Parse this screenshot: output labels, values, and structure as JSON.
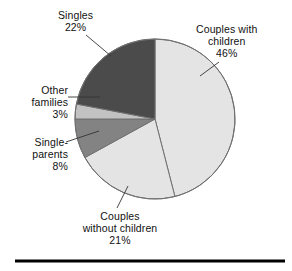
{
  "chart_data": {
    "type": "pie",
    "title": "",
    "subtitle": "",
    "xlabel": "",
    "ylabel": "",
    "legend_position": "none",
    "grid": false,
    "start_angle_deg": 0,
    "direction": "clockwise",
    "units": "percent",
    "categories": [
      "Couples with children",
      "Couples without children",
      "Single-parents",
      "Other families",
      "Singles"
    ],
    "values": [
      46,
      21,
      8,
      3,
      22
    ],
    "slices": [
      {
        "name": "couples-with-children",
        "label_lines": [
          "Couples with",
          "children",
          "46%"
        ],
        "value": 46,
        "value_text": "46%",
        "color": "#e4e4e4",
        "start_deg": 0,
        "end_deg": 165.6
      },
      {
        "name": "couples-without-children",
        "label_lines": [
          "Couples",
          "without children",
          "21%"
        ],
        "value": 21,
        "value_text": "21%",
        "color": "#e4e4e4",
        "start_deg": 165.6,
        "end_deg": 241.2
      },
      {
        "name": "single-parents",
        "label_lines": [
          "Single-",
          "parents",
          "8%"
        ],
        "value": 8,
        "value_text": "8%",
        "color": "#838383",
        "start_deg": 241.2,
        "end_deg": 270.0
      },
      {
        "name": "other-families",
        "label_lines": [
          "Other",
          "families",
          "3%"
        ],
        "value": 3,
        "value_text": "3%",
        "color": "#c2c2c2",
        "start_deg": 270.0,
        "end_deg": 280.8
      },
      {
        "name": "singles",
        "label_lines": [
          "Singles",
          "22%"
        ],
        "value": 22,
        "value_text": "22%",
        "color": "#4b4b4b",
        "start_deg": 280.8,
        "end_deg": 360.0
      }
    ],
    "total": 100,
    "outline_color": "#707070",
    "rule_color": "#000000"
  },
  "labels": {
    "couples_with_children": {
      "line1": "Couples with",
      "line2": "children",
      "line3": "46%"
    },
    "singles": {
      "line1": "Singles",
      "line2": "22%"
    },
    "other_families": {
      "line1": "Other",
      "line2": "families",
      "line3": "3%"
    },
    "single_parents": {
      "line1": "Single-",
      "line2": "parents",
      "line3": "8%"
    },
    "couples_without_children": {
      "line1": "Couples",
      "line2": "without children",
      "line3": "21%"
    }
  }
}
